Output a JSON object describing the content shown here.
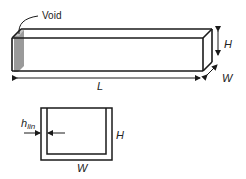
{
  "diagram": {
    "void_label": "Void",
    "dims": {
      "length": "L",
      "height": "H",
      "width": "W"
    },
    "cross_section": {
      "thickness_label_main": "h",
      "thickness_label_sub": "lin",
      "height": "H",
      "width": "W"
    },
    "colors": {
      "line": "#1a1a1a",
      "void_fill": "#8c8c8c",
      "void_light": "#bdbdbd"
    }
  }
}
